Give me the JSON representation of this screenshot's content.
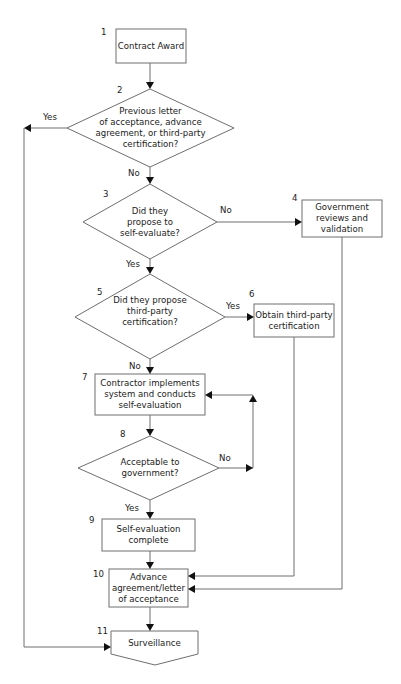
{
  "diagram": {
    "type": "flowchart",
    "nodes": [
      {
        "id": "1",
        "number": "1",
        "shape": "process",
        "lines": [
          "Contract Award"
        ]
      },
      {
        "id": "2",
        "number": "2",
        "shape": "decision",
        "lines": [
          "Previous letter",
          "of acceptance, advance",
          "agreement, or third-party",
          "certification?"
        ]
      },
      {
        "id": "3",
        "number": "3",
        "shape": "decision",
        "lines": [
          "Did they",
          "propose to",
          "self-evaluate?"
        ]
      },
      {
        "id": "4",
        "number": "4",
        "shape": "process",
        "lines": [
          "Government",
          "reviews and",
          "validation"
        ]
      },
      {
        "id": "5",
        "number": "5",
        "shape": "decision",
        "lines": [
          "Did they propose",
          "third-party",
          "certification?"
        ]
      },
      {
        "id": "6",
        "number": "6",
        "shape": "process",
        "lines": [
          "Obtain third-party",
          "certification"
        ]
      },
      {
        "id": "7",
        "number": "7",
        "shape": "process",
        "lines": [
          "Contractor implements",
          "system and conducts",
          "self-evaluation"
        ]
      },
      {
        "id": "8",
        "number": "8",
        "shape": "decision",
        "lines": [
          "Acceptable to",
          "government?"
        ]
      },
      {
        "id": "9",
        "number": "9",
        "shape": "process",
        "lines": [
          "Self-evaluation",
          "complete"
        ]
      },
      {
        "id": "10",
        "number": "10",
        "shape": "process",
        "lines": [
          "Advance",
          "agreement/letter",
          "of acceptance"
        ]
      },
      {
        "id": "11",
        "number": "11",
        "shape": "off-page-connector",
        "lines": [
          "Surveillance"
        ]
      }
    ],
    "edges": [
      {
        "from": "1",
        "to": "2",
        "label": ""
      },
      {
        "from": "2",
        "to": "11",
        "label": "Yes"
      },
      {
        "from": "2",
        "to": "3",
        "label": "No"
      },
      {
        "from": "3",
        "to": "4",
        "label": "No"
      },
      {
        "from": "3",
        "to": "5",
        "label": "Yes"
      },
      {
        "from": "5",
        "to": "6",
        "label": "Yes"
      },
      {
        "from": "5",
        "to": "7",
        "label": "No"
      },
      {
        "from": "7",
        "to": "8",
        "label": ""
      },
      {
        "from": "8",
        "to": "7",
        "label": "No"
      },
      {
        "from": "8",
        "to": "9",
        "label": "Yes"
      },
      {
        "from": "9",
        "to": "10",
        "label": ""
      },
      {
        "from": "6",
        "to": "10",
        "label": ""
      },
      {
        "from": "4",
        "to": "10",
        "label": ""
      },
      {
        "from": "10",
        "to": "11",
        "label": ""
      }
    ]
  },
  "labels": {
    "n1": {
      "num": "1",
      "l1": "Contract Award"
    },
    "n2": {
      "num": "2",
      "l1": "Previous letter",
      "l2": "of acceptance, advance",
      "l3": "agreement, or third-party",
      "l4": "certification?"
    },
    "n3": {
      "num": "3",
      "l1": "Did they",
      "l2": "propose to",
      "l3": "self-evaluate?"
    },
    "n4": {
      "num": "4",
      "l1": "Government",
      "l2": "reviews and",
      "l3": "validation"
    },
    "n5": {
      "num": "5",
      "l1": "Did they propose",
      "l2": "third-party",
      "l3": "certification?"
    },
    "n6": {
      "num": "6",
      "l1": "Obtain third-party",
      "l2": "certification"
    },
    "n7": {
      "num": "7",
      "l1": "Contractor implements",
      "l2": "system and conducts",
      "l3": "self-evaluation"
    },
    "n8": {
      "num": "8",
      "l1": "Acceptable to",
      "l2": "government?"
    },
    "n9": {
      "num": "9",
      "l1": "Self-evaluation",
      "l2": "complete"
    },
    "n10": {
      "num": "10",
      "l1": "Advance",
      "l2": "agreement/letter",
      "l3": "of acceptance"
    },
    "n11": {
      "num": "11",
      "l1": "Surveillance"
    },
    "e2_yes": "Yes",
    "e2_no": "No",
    "e3_no": "No",
    "e3_yes": "Yes",
    "e5_yes": "Yes",
    "e5_no": "No",
    "e8_no": "No",
    "e8_yes": "Yes"
  },
  "colors": {
    "stroke": "#6e6e6e",
    "arrowhead": "#111111",
    "text": "#222222",
    "background": "#ffffff"
  }
}
